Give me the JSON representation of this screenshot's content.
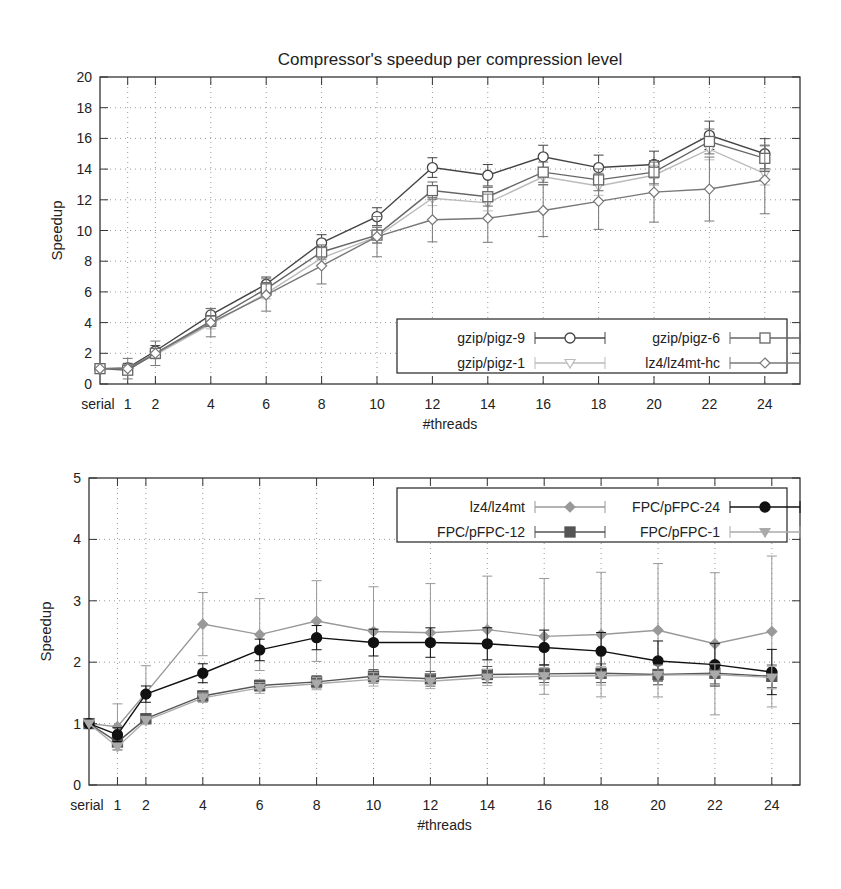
{
  "chart_data": [
    {
      "type": "line",
      "title": "Compressor's speedup per compression level",
      "xlabel": "#threads",
      "ylabel": "Speedup",
      "ylim": [
        0,
        20
      ],
      "yticks": [
        0,
        2,
        4,
        6,
        8,
        10,
        12,
        14,
        16,
        18,
        20
      ],
      "categories": [
        "serial",
        "1",
        "2",
        "4",
        "6",
        "8",
        "10",
        "12",
        "14",
        "16",
        "18",
        "20",
        "22",
        "24"
      ],
      "grid": true,
      "legend_position": "lower right",
      "series": [
        {
          "name": "gzip/pigz-9",
          "marker": "circle-open",
          "color": "#444444",
          "values": [
            1,
            1.05,
            2.15,
            4.5,
            6.5,
            9.2,
            10.9,
            14.1,
            13.6,
            14.8,
            14.1,
            14.3,
            16.2,
            15.0
          ]
        },
        {
          "name": "gzip/pigz-1",
          "marker": "triangle-down-open",
          "color": "#bbbbbb",
          "values": [
            1,
            1.0,
            1.9,
            3.9,
            5.9,
            8.2,
            9.6,
            12.1,
            11.8,
            13.5,
            12.9,
            13.6,
            15.3,
            13.7
          ]
        },
        {
          "name": "gzip/pigz-6",
          "marker": "square-open",
          "color": "#666666",
          "values": [
            1,
            0.9,
            2.0,
            4.1,
            6.2,
            8.6,
            9.7,
            12.6,
            12.2,
            13.8,
            13.3,
            13.8,
            15.8,
            14.7
          ]
        },
        {
          "name": "lz4/lz4mt-hc",
          "marker": "diamond-open",
          "color": "#777777",
          "values": [
            1,
            1.0,
            2.0,
            4.0,
            5.8,
            7.7,
            9.6,
            10.7,
            10.8,
            11.3,
            11.9,
            12.5,
            12.7,
            13.3
          ]
        }
      ]
    },
    {
      "type": "line",
      "title": "",
      "xlabel": "#threads",
      "ylabel": "Speedup",
      "ylim": [
        0,
        5
      ],
      "yticks": [
        0,
        1,
        2,
        3,
        4,
        5
      ],
      "categories": [
        "serial",
        "1",
        "2",
        "4",
        "6",
        "8",
        "10",
        "12",
        "14",
        "16",
        "18",
        "20",
        "22",
        "24"
      ],
      "grid": true,
      "legend_position": "upper right",
      "series": [
        {
          "name": "lz4/lz4mt",
          "marker": "diamond-filled",
          "color": "#999999",
          "values": [
            1,
            0.95,
            1.5,
            2.62,
            2.45,
            2.67,
            2.5,
            2.48,
            2.53,
            2.42,
            2.45,
            2.52,
            2.3,
            2.5
          ]
        },
        {
          "name": "FPC/pFPC-12",
          "marker": "square-filled",
          "color": "#555555",
          "values": [
            1,
            0.7,
            1.08,
            1.45,
            1.62,
            1.68,
            1.77,
            1.73,
            1.8,
            1.81,
            1.82,
            1.8,
            1.82,
            1.77
          ]
        },
        {
          "name": "FPC/pFPC-24",
          "marker": "circle-filled",
          "color": "#111111",
          "values": [
            1,
            0.82,
            1.48,
            1.82,
            2.2,
            2.4,
            2.32,
            2.32,
            2.3,
            2.24,
            2.18,
            2.02,
            1.96,
            1.84
          ]
        },
        {
          "name": "FPC/pFPC-1",
          "marker": "triangle-down-filled",
          "color": "#aaaaaa",
          "values": [
            1,
            0.62,
            1.05,
            1.42,
            1.58,
            1.65,
            1.72,
            1.69,
            1.75,
            1.77,
            1.78,
            1.79,
            1.8,
            1.75
          ]
        }
      ]
    }
  ]
}
